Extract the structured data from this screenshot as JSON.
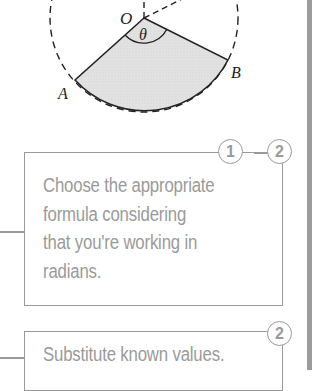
{
  "diagram": {
    "labels": {
      "center": "O",
      "angle": "θ",
      "point_a": "A",
      "point_b": "B"
    },
    "colors": {
      "sector_fill": "#e4e4e4",
      "line": "#222222"
    }
  },
  "steps": [
    {
      "badges": [
        "1",
        "2"
      ],
      "text": "Choose the appropriate formula considering that you're working in radians."
    },
    {
      "badges": [
        "2"
      ],
      "text": "Substitute known values."
    }
  ],
  "colors": {
    "annotation_gray": "#9a9a9a",
    "side_bar": "#9c9c9c"
  }
}
